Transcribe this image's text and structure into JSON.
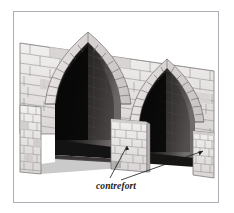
{
  "figure": {
    "title": "contrefort",
    "annotation_label": "contrefort",
    "frame": {
      "border_color": "#b0aab4",
      "background": "#ffffff"
    },
    "palette": {
      "stone_light": "#e9e7e6",
      "stone_mid": "#cfcccb",
      "stone_dark": "#a9a6a5",
      "mortar_line": "#8d8a89",
      "vault_shadow": "#151515",
      "vault_deep": "#0b0b0b",
      "brick_shadow": "#4a4746",
      "brick_mid": "#6e6b6a",
      "outline": "#3a3a3a",
      "leader_line": "#1a1a1a",
      "label_text": "#1a1a1a"
    },
    "parts": [
      {
        "name": "wall-parapet",
        "label": "parapet wall"
      },
      {
        "name": "left-arch",
        "label": "left pointed arch"
      },
      {
        "name": "right-arch",
        "label": "right pointed arch"
      },
      {
        "name": "center-buttress",
        "label": "contrefort"
      },
      {
        "name": "right-buttress",
        "label": "contrefort"
      },
      {
        "name": "left-pier",
        "label": "left pier"
      }
    ],
    "leaders": [
      {
        "name": "leader-to-center-buttress",
        "target": "center-buttress"
      },
      {
        "name": "leader-to-right-buttress",
        "target": "right-buttress"
      }
    ]
  }
}
